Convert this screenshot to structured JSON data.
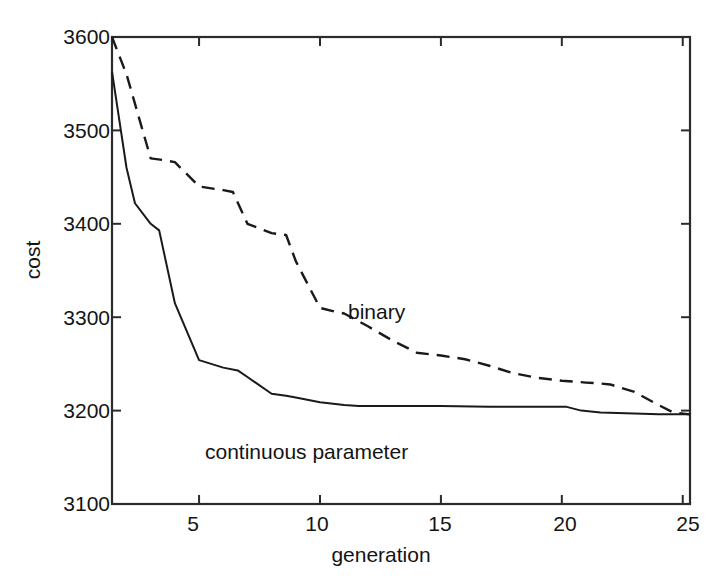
{
  "chart_data": {
    "type": "line",
    "title": "",
    "xlabel": "generation",
    "ylabel": "cost",
    "xlim": [
      1.4,
      25.3
    ],
    "ylim": [
      3100,
      3600
    ],
    "xticks": [
      5,
      10,
      15,
      20,
      25
    ],
    "yticks": [
      3100,
      3200,
      3300,
      3400,
      3500,
      3600
    ],
    "xtick_labels": [
      "5",
      "10",
      "15",
      "20",
      "25"
    ],
    "ytick_labels": [
      "3100",
      "3200",
      "3300",
      "3400",
      "3500",
      "3600"
    ],
    "grid": false,
    "legend_position": "inline-annotation",
    "series": [
      {
        "name": "binary",
        "style": "dashed",
        "color": "#1a1a1a",
        "label_x": 15.5,
        "label_y": 3312,
        "x": [
          1.4,
          2.0,
          3.0,
          3.6,
          4.0,
          5.0,
          6.0,
          6.4,
          7.0,
          8.0,
          8.6,
          9.0,
          10.0,
          10.6,
          11.0,
          12.0,
          13.0,
          14.0,
          15.0,
          16.0,
          17.0,
          18.0,
          19.0,
          20.0,
          21.0,
          21.6,
          22.0,
          23.0,
          24.0,
          24.6,
          25.3
        ],
        "y": [
          3600,
          3560,
          3470,
          3468,
          3466,
          3440,
          3436,
          3434,
          3400,
          3390,
          3388,
          3360,
          3310,
          3306,
          3304,
          3290,
          3275,
          3262,
          3259,
          3255,
          3248,
          3240,
          3235,
          3232,
          3230,
          3229,
          3228,
          3220,
          3206,
          3198,
          3196
        ]
      },
      {
        "name": "continuous parameter",
        "style": "solid",
        "color": "#1a1a1a",
        "label_x": 7.3,
        "label_y": 3158,
        "x": [
          1.4,
          2.0,
          2.35,
          3.0,
          3.35,
          4.0,
          5.0,
          6.0,
          6.6,
          7.0,
          8.0,
          8.6,
          9.0,
          10.0,
          11.0,
          11.6,
          12.0,
          13.0,
          15.0,
          17.0,
          19.0,
          20.2,
          20.8,
          21.6,
          23.0,
          24.0,
          25.3
        ],
        "y": [
          3563,
          3460,
          3422,
          3400,
          3393,
          3315,
          3254,
          3246,
          3243,
          3236,
          3218,
          3216,
          3214,
          3209,
          3206,
          3205,
          3205,
          3205,
          3205,
          3204,
          3204,
          3204,
          3200,
          3198,
          3197,
          3196,
          3196
        ]
      }
    ]
  },
  "axes": {
    "box_left_px": 112,
    "box_top_px": 37,
    "box_right_px": 690,
    "box_bottom_px": 504
  },
  "labels": {
    "y_axis_title": "cost",
    "x_axis_title": "generation",
    "binary_annotation": "binary",
    "continuous_annotation": "continuous parameter"
  }
}
